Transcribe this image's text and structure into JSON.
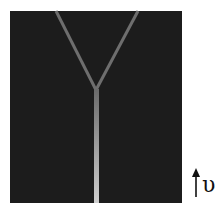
{
  "figure": {
    "background": "#1c1c1c",
    "branch_color": "#6e6e6e",
    "stem_color_top": "#6a6a6a",
    "stem_color_bottom": "#c8c8c8",
    "shape": "Y-junction"
  },
  "velocity_label": {
    "arrow": "up-arrow",
    "symbol": "υ"
  }
}
